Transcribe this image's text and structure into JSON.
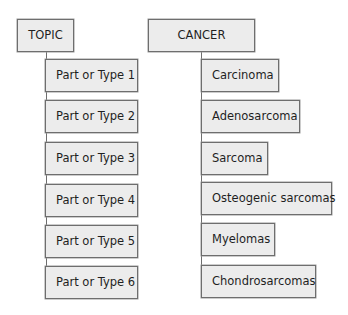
{
  "diagrams": [
    {
      "root": "TOPIC",
      "children": [
        "Part or Type 1",
        "Part or Type 2",
        "Part or Type 3",
        "Part or Type 4",
        "Part or Type 5",
        "Part or Type 6"
      ]
    },
    {
      "root": "CANCER",
      "children": [
        "Carcinoma",
        "Adenosarcoma",
        "Sarcoma",
        "Osteogenic sarcomas",
        "Myelomas",
        "Chondrosarcomas"
      ]
    }
  ],
  "colors": {
    "box_fill": "#ececec",
    "box_border": "#6e6e6e",
    "text": "#1f1f1f"
  }
}
